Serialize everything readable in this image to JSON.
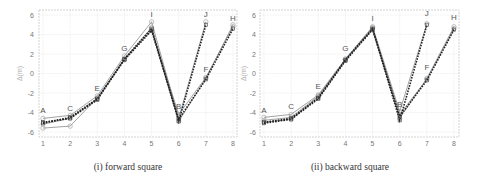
{
  "chart_data": [
    {
      "type": "line",
      "id": "forward",
      "caption": "(i) forward square",
      "xlabel": "",
      "ylabel": "Δ(m)",
      "xlim": [
        1,
        8
      ],
      "ylim": [
        -6.5,
        6.5
      ],
      "xticks": [
        1,
        2,
        3,
        4,
        5,
        6,
        7,
        8
      ],
      "yticks": [
        -6,
        -4,
        -2,
        0,
        2,
        4,
        6
      ],
      "grid": true,
      "point_labels": [
        {
          "text": "A",
          "x": 1,
          "y": -4.1
        },
        {
          "text": "C",
          "x": 2,
          "y": -3.8
        },
        {
          "text": "E",
          "x": 3,
          "y": -1.8
        },
        {
          "text": "G",
          "x": 4,
          "y": 2.3
        },
        {
          "text": "I",
          "x": 5,
          "y": 5.8
        },
        {
          "text": "B",
          "x": 6,
          "y": -3.6
        },
        {
          "text": "J",
          "x": 7,
          "y": 5.8
        },
        {
          "text": "F",
          "x": 7,
          "y": 0.2
        },
        {
          "text": "H",
          "x": 8,
          "y": 5.4
        }
      ],
      "series": [
        {
          "name": "gray-1",
          "style": "solid-gray",
          "x": [
            1,
            2,
            3,
            4,
            5,
            6,
            7
          ],
          "y": [
            -4.6,
            -4.3,
            -2.3,
            1.8,
            5.3,
            -4.6,
            5.3
          ]
        },
        {
          "name": "gray-2",
          "style": "solid-gray",
          "x": [
            1,
            2,
            3,
            4,
            5,
            6,
            7,
            8
          ],
          "y": [
            -5.6,
            -5.4,
            -2.5,
            1.5,
            4.7,
            -4.9,
            -0.5,
            5.0
          ]
        },
        {
          "name": "gray-3",
          "style": "solid-gray",
          "x": [
            1,
            2,
            3,
            4,
            5,
            6,
            7,
            8
          ],
          "y": [
            -5.2,
            -4.6,
            -2.6,
            1.4,
            4.5,
            -4.2,
            -0.4,
            4.8
          ]
        },
        {
          "name": "dashed-1",
          "style": "dashed-black",
          "x": [
            1,
            2,
            3,
            4,
            5,
            6,
            7
          ],
          "y": [
            -5.0,
            -4.6,
            -2.7,
            1.5,
            4.6,
            -4.9,
            5.0
          ]
        },
        {
          "name": "dashed-2",
          "style": "dashed-black",
          "x": [
            1,
            2,
            3,
            4,
            5,
            6,
            7,
            8
          ],
          "y": [
            -5.1,
            -4.5,
            -2.6,
            1.4,
            4.4,
            -4.7,
            -0.6,
            4.6
          ]
        }
      ]
    },
    {
      "type": "line",
      "id": "backward",
      "caption": "(ii) backward square",
      "xlabel": "",
      "ylabel": "Δ(m)",
      "xlim": [
        1,
        8
      ],
      "ylim": [
        -6.5,
        6.5
      ],
      "xticks": [
        1,
        2,
        3,
        4,
        5,
        6,
        7,
        8
      ],
      "yticks": [
        -6,
        -4,
        -2,
        0,
        2,
        4,
        6
      ],
      "grid": true,
      "point_labels": [
        {
          "text": "A",
          "x": 1,
          "y": -4.0
        },
        {
          "text": "C",
          "x": 2,
          "y": -3.6
        },
        {
          "text": "E",
          "x": 3,
          "y": -1.6
        },
        {
          "text": "G",
          "x": 4,
          "y": 2.3
        },
        {
          "text": "I",
          "x": 5,
          "y": 5.4
        },
        {
          "text": "B",
          "x": 6,
          "y": -3.4
        },
        {
          "text": "J",
          "x": 7,
          "y": 5.9
        },
        {
          "text": "F",
          "x": 7,
          "y": 0.4
        },
        {
          "text": "H",
          "x": 8,
          "y": 5.5
        }
      ],
      "series": [
        {
          "name": "gray-1",
          "style": "solid-gray",
          "x": [
            1,
            2,
            3,
            4,
            5,
            6,
            7
          ],
          "y": [
            -4.5,
            -4.2,
            -2.2,
            1.5,
            4.8,
            -3.9,
            5.1
          ]
        },
        {
          "name": "gray-2",
          "style": "solid-gray",
          "x": [
            1,
            2,
            3,
            4,
            5,
            6,
            7,
            8
          ],
          "y": [
            -4.8,
            -4.5,
            -2.3,
            1.4,
            4.7,
            -4.6,
            -0.5,
            4.8
          ]
        },
        {
          "name": "gray-3",
          "style": "solid-gray",
          "x": [
            1,
            2,
            3,
            4,
            5,
            6,
            7,
            8
          ],
          "y": [
            -5.0,
            -4.7,
            -2.4,
            1.4,
            4.6,
            -4.2,
            -0.6,
            4.6
          ]
        },
        {
          "name": "dashed-1",
          "style": "dashed-black",
          "x": [
            1,
            2,
            3,
            4,
            5,
            6,
            7
          ],
          "y": [
            -5.0,
            -4.6,
            -2.5,
            1.4,
            4.6,
            -4.8,
            5.0
          ]
        },
        {
          "name": "dashed-2",
          "style": "dashed-black",
          "x": [
            1,
            2,
            3,
            4,
            5,
            6,
            7,
            8
          ],
          "y": [
            -5.1,
            -4.7,
            -2.6,
            1.3,
            4.5,
            -4.4,
            -0.7,
            4.5
          ]
        }
      ]
    }
  ],
  "colors": {
    "solid_gray": "#8a8a8a",
    "dashed_black": "#222222",
    "marker_gray": "#9a9a9a"
  }
}
